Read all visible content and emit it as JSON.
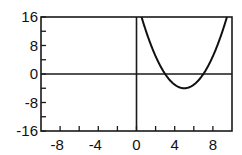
{
  "chart_data": {
    "type": "line",
    "title": "",
    "xlabel": "",
    "ylabel": "",
    "xlim": [
      -10,
      10
    ],
    "ylim": [
      -16,
      16
    ],
    "x_ticks": [
      -8,
      -6,
      -4,
      -2,
      0,
      2,
      4,
      6,
      8
    ],
    "x_tick_labels": [
      "-8",
      "-4",
      "0",
      "4",
      "8"
    ],
    "x_tick_label_values": [
      -8,
      -4,
      0,
      4,
      8
    ],
    "y_ticks": [
      -16,
      -12,
      -8,
      -4,
      0,
      4,
      8,
      12,
      16
    ],
    "y_tick_labels": [
      "16",
      "8",
      "0",
      "-8",
      "-16"
    ],
    "y_tick_label_values": [
      16,
      8,
      0,
      -8,
      -16
    ],
    "grid": false,
    "axes_through_origin": true,
    "series": [
      {
        "name": "f(x) = (x - 5)^2 - 4",
        "function": "x^2 - 10x + 21",
        "vertex": [
          5,
          -4
        ],
        "roots": [
          3,
          7
        ],
        "x": [
          0.53,
          1,
          2,
          3,
          4,
          5,
          6,
          7,
          8,
          9,
          9.47
        ],
        "values": [
          16,
          12,
          5,
          0,
          -3,
          -4,
          -3,
          0,
          5,
          12,
          16
        ],
        "color": "#111111"
      }
    ]
  }
}
